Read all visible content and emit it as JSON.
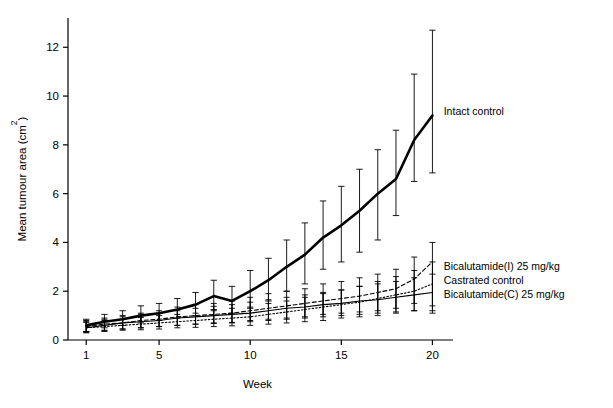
{
  "chart_data": {
    "type": "line",
    "title": "",
    "xlabel": "Week",
    "ylabel": "Mean tumour area (cm2)",
    "ylabel_display": "Mean tumour area (cm",
    "ylabel_sup": "2",
    "ylabel_tail": ")",
    "xlim": [
      0,
      20.8
    ],
    "ylim": [
      0,
      13.2
    ],
    "xticks": [
      1,
      5,
      10,
      15,
      20
    ],
    "yticks": [
      0,
      2,
      4,
      6,
      8,
      10,
      12
    ],
    "grid": false,
    "legend_position": "inline-right-labels",
    "x": [
      1,
      2,
      3,
      4,
      5,
      6,
      7,
      8,
      9,
      10,
      11,
      12,
      13,
      14,
      15,
      16,
      17,
      18,
      19,
      20
    ],
    "series": [
      {
        "name": "Intact control",
        "style": "solid-thick",
        "values": [
          0.6,
          0.75,
          0.85,
          1.0,
          1.1,
          1.25,
          1.45,
          1.8,
          1.6,
          2.0,
          2.45,
          3.0,
          3.5,
          4.2,
          4.7,
          5.3,
          6.0,
          6.6,
          8.2,
          9.2
        ],
        "err_low": [
          0.35,
          0.5,
          0.6,
          0.7,
          0.8,
          0.9,
          1.0,
          1.25,
          1.1,
          1.3,
          1.6,
          2.0,
          2.3,
          2.9,
          3.2,
          3.6,
          4.1,
          5.1,
          6.5,
          6.85
        ],
        "err_high": [
          0.85,
          1.05,
          1.2,
          1.4,
          1.5,
          1.7,
          1.95,
          2.45,
          2.2,
          2.85,
          3.35,
          4.1,
          4.8,
          5.7,
          6.3,
          7.0,
          7.8,
          8.6,
          10.9,
          12.7
        ]
      },
      {
        "name": "Bicalutamide(I) 25 mg/kg",
        "style": "dashed",
        "values": [
          0.55,
          0.65,
          0.7,
          0.8,
          0.85,
          0.95,
          1.0,
          1.05,
          1.1,
          1.2,
          1.3,
          1.4,
          1.5,
          1.6,
          1.7,
          1.8,
          1.95,
          2.1,
          2.5,
          3.2
        ],
        "err_low": [
          0.35,
          0.4,
          0.45,
          0.5,
          0.55,
          0.6,
          0.65,
          0.7,
          0.7,
          0.8,
          0.85,
          0.9,
          0.95,
          1.05,
          1.1,
          1.15,
          1.2,
          1.3,
          1.5,
          1.2
        ],
        "err_high": [
          0.8,
          0.9,
          1.0,
          1.1,
          1.2,
          1.35,
          1.45,
          1.5,
          1.6,
          1.75,
          1.9,
          2.0,
          2.1,
          2.3,
          2.4,
          2.55,
          2.7,
          2.9,
          3.4,
          4.0
        ]
      },
      {
        "name": "Castrated control",
        "style": "dotted",
        "values": [
          0.5,
          0.55,
          0.6,
          0.65,
          0.7,
          0.75,
          0.8,
          0.85,
          0.9,
          0.95,
          1.05,
          1.15,
          1.25,
          1.35,
          1.45,
          1.55,
          1.7,
          1.85,
          2.0,
          2.3
        ],
        "err_low": [
          0.3,
          0.35,
          0.4,
          0.42,
          0.45,
          0.5,
          0.52,
          0.55,
          0.58,
          0.6,
          0.65,
          0.7,
          0.75,
          0.8,
          0.9,
          0.95,
          1.0,
          1.1,
          1.2,
          1.4
        ],
        "err_high": [
          0.75,
          0.8,
          0.85,
          0.92,
          1.0,
          1.05,
          1.1,
          1.2,
          1.3,
          1.35,
          1.5,
          1.6,
          1.75,
          1.9,
          2.05,
          2.2,
          2.4,
          2.6,
          2.85,
          3.2
        ]
      },
      {
        "name": "Bicalutamide(C) 25 mg/kg",
        "style": "solid-thin",
        "values": [
          0.5,
          0.6,
          0.7,
          0.75,
          0.8,
          0.9,
          0.95,
          1.0,
          1.05,
          1.1,
          1.2,
          1.3,
          1.35,
          1.45,
          1.5,
          1.6,
          1.65,
          1.75,
          1.85,
          1.95
        ],
        "err_low": [
          0.3,
          0.38,
          0.45,
          0.5,
          0.55,
          0.6,
          0.65,
          0.68,
          0.72,
          0.75,
          0.8,
          0.85,
          0.9,
          0.95,
          1.0,
          1.05,
          1.1,
          1.15,
          1.2,
          1.1
        ],
        "err_high": [
          0.72,
          0.85,
          0.95,
          1.05,
          1.1,
          1.2,
          1.3,
          1.38,
          1.45,
          1.55,
          1.65,
          1.75,
          1.85,
          1.95,
          2.05,
          2.2,
          2.3,
          2.4,
          2.55,
          2.7
        ]
      }
    ],
    "annotations": [
      {
        "text": "Intact control",
        "x": 20.4,
        "y": 9.4
      },
      {
        "text": "Bicalutamide(I) 25 mg/kg",
        "x": 20.4,
        "y": 3.05
      },
      {
        "text": "Castrated control",
        "x": 20.4,
        "y": 2.45
      },
      {
        "text": "Bicalutamide(C) 25 mg/kg",
        "x": 20.4,
        "y": 1.9
      }
    ]
  }
}
